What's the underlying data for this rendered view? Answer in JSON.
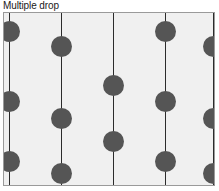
{
  "figure": {
    "title": "Multiple drop",
    "panel": {
      "background_color": "#f0f0f0",
      "border_color": "#9a9a9a",
      "width": 212,
      "height": 174
    }
  },
  "chart_data": {
    "type": "scatter",
    "title": "Multiple drop",
    "subtitle": "",
    "xlabel": "",
    "ylabel": "",
    "grid": false,
    "legend_position": "none",
    "xlim": [
      0,
      212
    ],
    "ylim": [
      0,
      174
    ],
    "motif": {
      "shape": "circle",
      "diameter": 21,
      "color": "#555555"
    },
    "repeat_lines": {
      "orientation": "vertical",
      "color": "#2b2b2b",
      "x": [
        5,
        57,
        109,
        161,
        209
      ]
    },
    "points": [
      {
        "x": 5,
        "y": 18
      },
      {
        "x": 57,
        "y": 33
      },
      {
        "x": 109,
        "y": 72
      },
      {
        "x": 161,
        "y": 18
      },
      {
        "x": 209,
        "y": 33
      },
      {
        "x": 5,
        "y": 88
      },
      {
        "x": 57,
        "y": 105
      },
      {
        "x": 109,
        "y": 128
      },
      {
        "x": 161,
        "y": 88
      },
      {
        "x": 209,
        "y": 105
      },
      {
        "x": 5,
        "y": 148
      },
      {
        "x": 57,
        "y": 160
      },
      {
        "x": 161,
        "y": 148
      },
      {
        "x": 209,
        "y": 160
      }
    ]
  }
}
